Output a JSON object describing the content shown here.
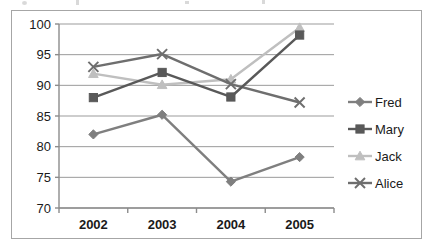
{
  "chart_data": {
    "type": "line",
    "title": "",
    "subtitle": "",
    "xlabel": "",
    "ylabel": "",
    "categories": [
      "2002",
      "2003",
      "2004",
      "2005"
    ],
    "x": [
      2002,
      2003,
      2004,
      2005
    ],
    "ylim": [
      70,
      100
    ],
    "yticks": [
      70,
      75,
      80,
      85,
      90,
      95,
      100
    ],
    "ytick_labels": [
      "70",
      "75",
      "80",
      "85",
      "90",
      "95",
      "100"
    ],
    "grid": "horizontal",
    "legend_position": "right",
    "series": [
      {
        "name": "Fred",
        "marker": "diamond",
        "color": "#7f7f7f",
        "values": [
          82.0,
          85.2,
          74.3,
          78.3
        ]
      },
      {
        "name": "Mary",
        "marker": "square",
        "color": "#595959",
        "values": [
          88.0,
          92.1,
          88.1,
          98.2
        ]
      },
      {
        "name": "Jack",
        "marker": "triangle",
        "color": "#bfbfbf",
        "values": [
          91.9,
          90.1,
          91.0,
          99.4
        ]
      },
      {
        "name": "Alice",
        "marker": "cross",
        "color": "#6e6e6e",
        "values": [
          93.0,
          95.1,
          90.2,
          87.2
        ]
      }
    ]
  },
  "legend": {
    "entries": [
      {
        "label": "Fred"
      },
      {
        "label": "Mary"
      },
      {
        "label": "Jack"
      },
      {
        "label": "Alice"
      }
    ]
  },
  "axes": {
    "y_axis_name": "value-axis",
    "x_axis_name": "year-axis"
  },
  "colors": {
    "frame_border": "#a6a6a6",
    "gridline": "#9b9b9b",
    "axis_line": "#8c8c8c",
    "text": "#1a1a1a",
    "background": "#ffffff"
  }
}
